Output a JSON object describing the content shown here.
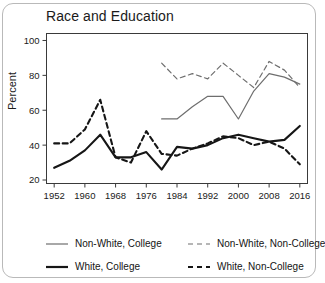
{
  "figure": {
    "title": "Race and Education",
    "ylabel": "Percent"
  },
  "legend": {
    "items": [
      {
        "label": "Non-White, College",
        "style": "solid",
        "color": "#6e6e6e",
        "width": 1.2
      },
      {
        "label": "Non-White, Non-College",
        "style": "dashed",
        "color": "#6e6e6e",
        "width": 1.2
      },
      {
        "label": "White, College",
        "style": "solid",
        "color": "#161616",
        "width": 2.2
      },
      {
        "label": "White, Non-College",
        "style": "dashed",
        "color": "#161616",
        "width": 2.0
      }
    ]
  },
  "chart_data": {
    "type": "line",
    "title": "Race and Education",
    "xlabel": "",
    "ylabel": "Percent",
    "xlim": [
      1950,
      2018
    ],
    "ylim": [
      18,
      104
    ],
    "xticks": [
      1952,
      1960,
      1968,
      1976,
      1984,
      1992,
      2000,
      2008,
      2016
    ],
    "yticks": [
      20,
      40,
      60,
      80,
      100
    ],
    "grid": false,
    "legend_position": "below",
    "series": [
      {
        "name": "Non-White, College",
        "style": "solid",
        "color": "#6e6e6e",
        "x": [
          1980,
          1984,
          1988,
          1992,
          1996,
          2000,
          2004,
          2008,
          2012,
          2016
        ],
        "y": [
          55,
          55,
          62,
          68,
          68,
          55,
          71,
          81,
          79,
          75
        ]
      },
      {
        "name": "Non-White, Non-College",
        "style": "dashed",
        "color": "#6e6e6e",
        "x": [
          1980,
          1984,
          1988,
          1992,
          1996,
          2000,
          2004,
          2008,
          2012,
          2016
        ],
        "y": [
          87,
          78,
          81,
          78,
          87,
          80,
          73,
          88,
          83,
          73
        ]
      },
      {
        "name": "White, College",
        "style": "solid",
        "color": "#161616",
        "x": [
          1952,
          1956,
          1960,
          1964,
          1968,
          1972,
          1976,
          1980,
          1984,
          1988,
          1992,
          1996,
          2000,
          2004,
          2008,
          2012,
          2016
        ],
        "y": [
          27,
          31,
          37,
          46,
          33,
          33,
          36,
          26,
          39,
          38,
          40,
          44,
          46,
          44,
          42,
          43,
          51
        ]
      },
      {
        "name": "White, Non-College",
        "style": "dashed",
        "color": "#161616",
        "x": [
          1952,
          1956,
          1960,
          1964,
          1968,
          1972,
          1976,
          1980,
          1984,
          1988,
          1992,
          1996,
          2000,
          2004,
          2008,
          2012,
          2016
        ],
        "y": [
          41,
          41,
          49,
          66,
          33,
          30,
          48,
          35,
          34,
          38,
          41,
          45,
          44,
          40,
          42,
          38,
          29
        ]
      }
    ]
  }
}
